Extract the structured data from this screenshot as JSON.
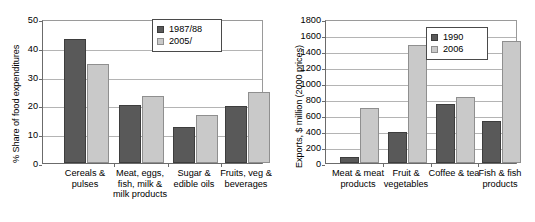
{
  "chart_data": [
    {
      "id": "left",
      "type": "bar",
      "title": "",
      "xlabel": "",
      "ylabel": "% Share of food expenditures",
      "ylim": [
        0,
        50
      ],
      "ytick_step": 10,
      "yticks": [
        50,
        40,
        30,
        20,
        10,
        0
      ],
      "grid": true,
      "legend_position": "top-right",
      "categories": [
        "Cereals & pulses",
        "Meat, eggs, fish, milk & milk products",
        "Sugar & edible oils",
        "Fruits, veg & beverages"
      ],
      "series": [
        {
          "name": "1987/88",
          "color": "#595959",
          "values": [
            43.0,
            20.3,
            12.6,
            19.9
          ]
        },
        {
          "name": "2005/",
          "color": "#c9c9c9",
          "values": [
            34.5,
            23.3,
            16.5,
            24.8
          ]
        }
      ]
    },
    {
      "id": "right",
      "type": "bar",
      "title": "",
      "xlabel": "",
      "ylabel": "Exports, $ million (2000 prices)",
      "ylim": [
        0,
        1800
      ],
      "ytick_step": 200,
      "yticks": [
        1800,
        1600,
        1400,
        1200,
        1000,
        800,
        600,
        400,
        200,
        0
      ],
      "grid": true,
      "legend_position": "top-right",
      "categories": [
        "Meat & meat products",
        "Fruit & vegetables",
        "Coffee & tea",
        "Fish & fish products"
      ],
      "series": [
        {
          "name": "1990",
          "color": "#595959",
          "values": [
            80,
            390,
            740,
            520
          ]
        },
        {
          "name": "2006",
          "color": "#c9c9c9",
          "values": [
            690,
            1480,
            820,
            1530
          ]
        }
      ]
    }
  ]
}
